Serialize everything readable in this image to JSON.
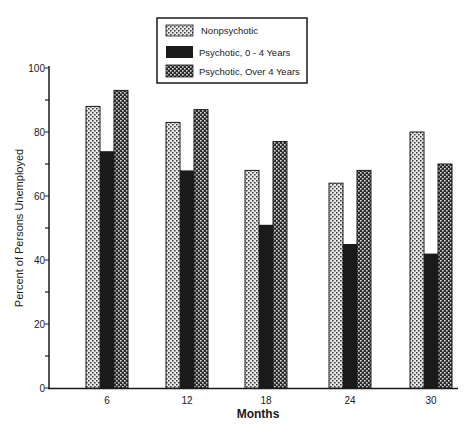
{
  "chart_data": {
    "type": "bar",
    "title": "",
    "xlabel": "Months",
    "ylabel": "Percent of Persons Unemployed",
    "ylim": [
      0,
      100
    ],
    "yticks_major": [
      0,
      20,
      40,
      60,
      80,
      100
    ],
    "yticks_minor": [
      10,
      30,
      50,
      70,
      90
    ],
    "grid": false,
    "legend_position": "top-center",
    "categories": [
      "6",
      "12",
      "18",
      "24",
      "30"
    ],
    "series": [
      {
        "name": "Nonpsychotic",
        "pattern": "light-dotted",
        "values": [
          88,
          83,
          68,
          64,
          80
        ]
      },
      {
        "name": "Psychotic, 0 - 4 Years",
        "pattern": "solid-black",
        "values": [
          74,
          68,
          51,
          45,
          42
        ]
      },
      {
        "name": "Psychotic, Over 4 Years",
        "pattern": "dark-checkered",
        "values": [
          93,
          87,
          77,
          68,
          70
        ]
      }
    ]
  },
  "legend": {
    "items": [
      {
        "label": "Nonpsychotic"
      },
      {
        "label": "Psychotic, 0 - 4 Years"
      },
      {
        "label": "Psychotic, Over 4 Years"
      }
    ]
  },
  "colors": {
    "ink": "#1a1a1a",
    "background": "#ffffff"
  }
}
